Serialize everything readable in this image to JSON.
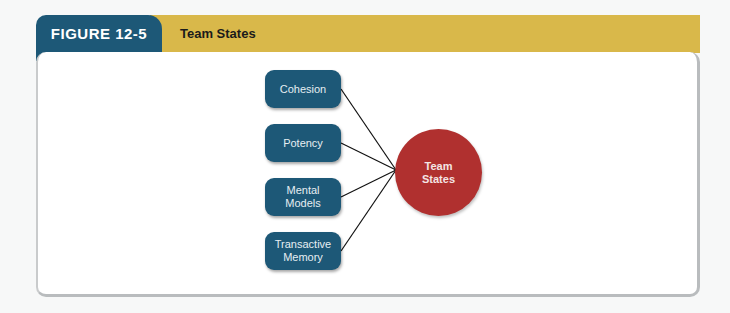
{
  "header": {
    "figure_label": "FIGURE 12-5",
    "title": "Team States"
  },
  "diagram": {
    "center": {
      "label_line1": "Team",
      "label_line2": "States",
      "color": "#b0302f"
    },
    "nodes": [
      {
        "label": "Cohesion"
      },
      {
        "label": "Potency"
      },
      {
        "label_line1": "Mental",
        "label_line2": "Models"
      },
      {
        "label_line1": "Transactive",
        "label_line2": "Memory"
      }
    ],
    "node_color": "#1d5877",
    "header_tab_color": "#1d5877",
    "header_bar_color": "#d9b84a"
  }
}
